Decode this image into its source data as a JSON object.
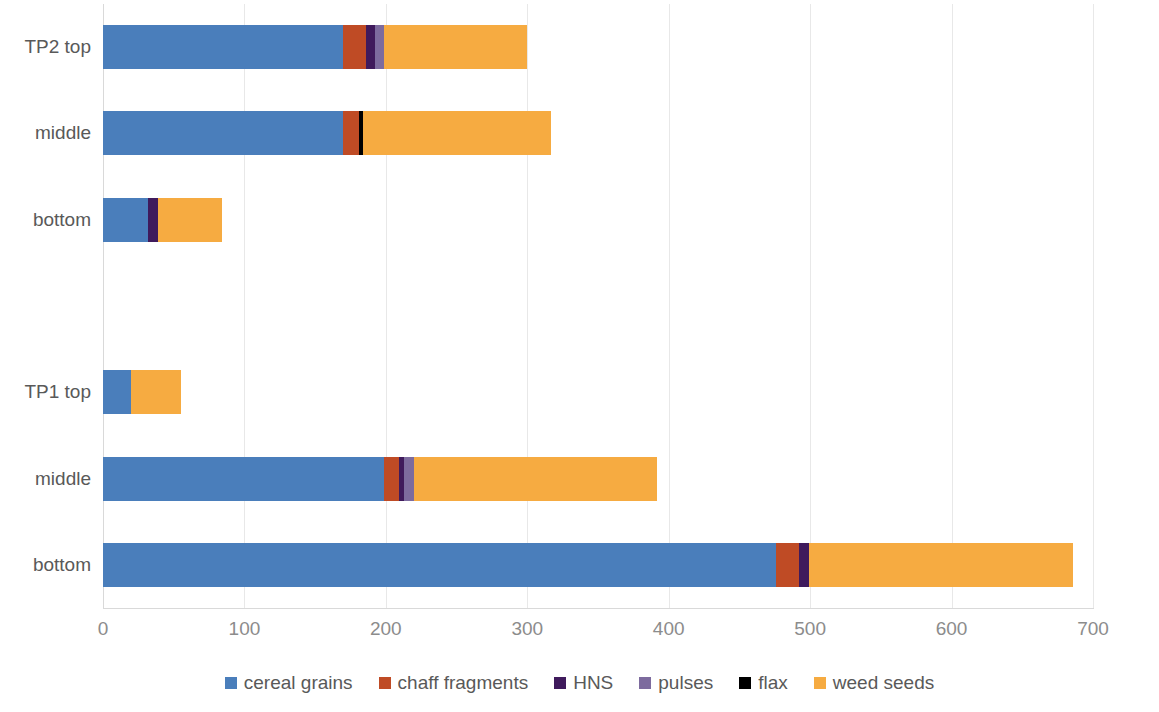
{
  "chart_data": {
    "type": "bar",
    "orientation": "horizontal",
    "stacked": true,
    "title": "",
    "xlabel": "",
    "ylabel": "",
    "xlim": [
      0,
      700
    ],
    "xticks": [
      0,
      100,
      200,
      300,
      400,
      500,
      600,
      700
    ],
    "xtick_labels": [
      "0",
      "100",
      "200",
      "300",
      "400",
      "500",
      "600",
      "700"
    ],
    "grid": "vertical",
    "legend_position": "bottom",
    "categories": [
      "TP2 top",
      "middle",
      "bottom",
      "",
      "TP1 top",
      "middle",
      "bottom"
    ],
    "series": [
      {
        "name": "cereal grains",
        "color": "#4a7ebb",
        "values": [
          170,
          170,
          32,
          0,
          20,
          199,
          476
        ]
      },
      {
        "name": "chaff fragments",
        "color": "#bf4b25",
        "values": [
          16,
          11,
          0,
          0,
          0,
          10,
          16
        ]
      },
      {
        "name": "HNS",
        "color": "#3f1a5c",
        "values": [
          6,
          0,
          7,
          0,
          0,
          4,
          7
        ]
      },
      {
        "name": "pulses",
        "color": "#7d6b9e",
        "values": [
          7,
          0,
          0,
          0,
          0,
          7,
          0
        ]
      },
      {
        "name": "flax",
        "color": "#000000",
        "values": [
          0,
          3,
          0,
          0,
          0,
          0,
          0
        ]
      },
      {
        "name": "weed seeds",
        "color": "#f6ab41",
        "values": [
          101,
          133,
          45,
          0,
          35,
          172,
          187
        ]
      }
    ],
    "totals": [
      300,
      317,
      84,
      0,
      55,
      392,
      686
    ]
  },
  "axis": {
    "tick_labels": [
      "0",
      "100",
      "200",
      "300",
      "400",
      "500",
      "600",
      "700"
    ]
  },
  "category_labels": [
    "TP2 top",
    "middle",
    "bottom",
    "",
    "TP1 top",
    "middle",
    "bottom"
  ],
  "legend": {
    "items": [
      {
        "label": "cereal grains",
        "color": "#4a7ebb"
      },
      {
        "label": "chaff fragments",
        "color": "#bf4b25"
      },
      {
        "label": "HNS",
        "color": "#3f1a5c"
      },
      {
        "label": "pulses",
        "color": "#7d6b9e"
      },
      {
        "label": "flax",
        "color": "#000000"
      },
      {
        "label": "weed seeds",
        "color": "#f6ab41"
      }
    ]
  },
  "colors": {
    "gridline": "#e8e8e8",
    "axis": "#d9d9d9",
    "tick_text": "#8c8c8c",
    "label_text": "#595959",
    "background": "#ffffff"
  }
}
